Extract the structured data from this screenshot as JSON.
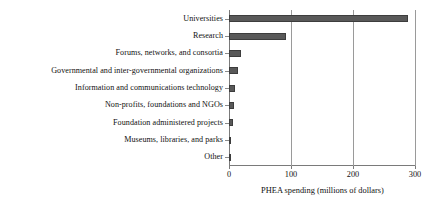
{
  "chart_data": {
    "type": "bar",
    "orientation": "horizontal",
    "title": "",
    "xlabel": "PHEA spending  (millions  of dollars)",
    "ylabel": "",
    "xlim": [
      0,
      300
    ],
    "xticks": [
      0,
      100,
      200,
      300
    ],
    "xtick_labels": [
      "0",
      "100",
      "200",
      "300"
    ],
    "grid": "vertical",
    "legend": null,
    "bar_color": "#595959",
    "categories": [
      "Universities",
      "Research",
      "Forums, networks, and consortia",
      "Governmental and inter-governmental organizations",
      "Information and communications technology",
      "Non-profits, foundations and NGOs",
      "Foundation administered projects",
      "Museums, libraries, and parks",
      "Other"
    ],
    "values": [
      288,
      92,
      20,
      15,
      9,
      8,
      6,
      4,
      2
    ]
  }
}
